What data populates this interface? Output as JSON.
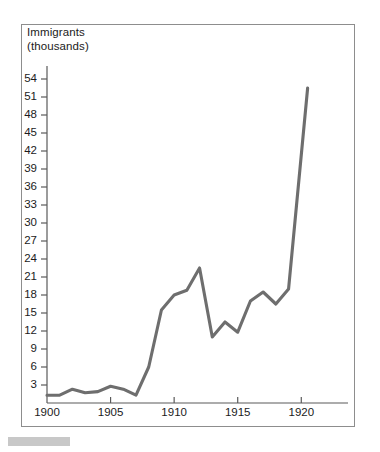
{
  "figure": {
    "frame_border_color": "#8d8d8d",
    "background_color": "#ffffff",
    "axis_color": "#5a5a5a",
    "line_color": "#6e6e6e",
    "text_color": "#1b1b1b",
    "artifact_color": "#c8c8c8"
  },
  "axis_title": "Immigrants\n(thousands)",
  "chart_data": {
    "type": "line",
    "title": "Immigrants (thousands)",
    "xlabel": "",
    "ylabel": "Immigrants (thousands)",
    "xlim": [
      1900,
      1921
    ],
    "ylim": [
      0,
      55
    ],
    "grid": false,
    "legend": "none",
    "y_ticks": [
      3,
      6,
      9,
      12,
      15,
      18,
      21,
      24,
      27,
      30,
      33,
      36,
      39,
      42,
      45,
      48,
      51,
      54
    ],
    "y_tick_labels": [
      "3",
      "6",
      "9",
      "12",
      "15",
      "18",
      "21",
      "24",
      "27",
      "30",
      "33",
      "36",
      "39",
      "42",
      "45",
      "48",
      "51",
      "54"
    ],
    "x_ticks": [
      1900,
      1905,
      1910,
      1915,
      1920
    ],
    "x_tick_labels": [
      "1900",
      "1905",
      "1910",
      "1915",
      "1920"
    ],
    "x": [
      1900,
      1901,
      1902,
      1903,
      1904,
      1905,
      1906,
      1907,
      1908,
      1909,
      1910,
      1911,
      1912,
      1913,
      1914,
      1915,
      1916,
      1917,
      1918,
      1919,
      1920.5
    ],
    "values": [
      1.3,
      1.3,
      2.3,
      1.7,
      1.9,
      2.8,
      2.3,
      1.3,
      6.0,
      15.5,
      18.0,
      18.8,
      22.5,
      11.0,
      13.5,
      11.8,
      17.0,
      18.5,
      16.5,
      19.0,
      52.5
    ],
    "series": [
      {
        "name": "Immigrants",
        "values": [
          1.3,
          1.3,
          2.3,
          1.7,
          1.9,
          2.8,
          2.3,
          1.3,
          6.0,
          15.5,
          18.0,
          18.8,
          22.5,
          11.0,
          13.5,
          11.8,
          17.0,
          18.5,
          16.5,
          19.0,
          52.5
        ]
      }
    ]
  }
}
